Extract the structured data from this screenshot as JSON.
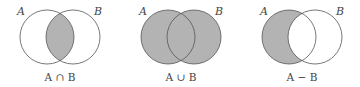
{
  "colors": {
    "fill": "#b3b3b3",
    "stroke": "#555555",
    "background": "#ffffff"
  },
  "panels": [
    {
      "id": "intersection",
      "set_a_label": "A",
      "set_b_label": "B",
      "caption": "A ∩ B",
      "shaded_region": "intersection"
    },
    {
      "id": "union",
      "set_a_label": "A",
      "set_b_label": "B",
      "caption": "A ∪ B",
      "shaded_region": "union"
    },
    {
      "id": "difference",
      "set_a_label": "A",
      "set_b_label": "B",
      "caption": "A − B",
      "shaded_region": "A only"
    }
  ]
}
